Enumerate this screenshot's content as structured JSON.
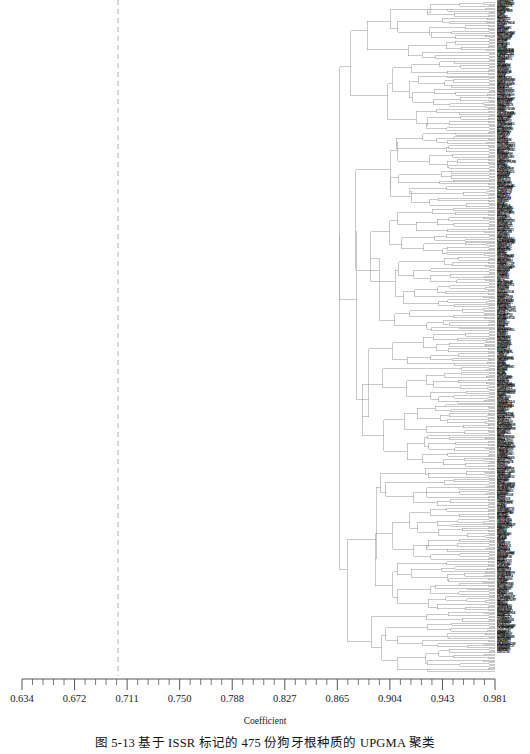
{
  "figure": {
    "caption": "图 5-13  基于 ISSR 标记的 475 份狗牙根种质的 UPGMA 聚类",
    "axis_title": "Coefficient",
    "sample_count": 475
  },
  "axis": {
    "tick_labels": [
      "0.634",
      "0.672",
      "0.711",
      "0.750",
      "0.788",
      "0.827",
      "0.865",
      "0.904",
      "0.943",
      "0.981"
    ],
    "minor_ticks_per_interval": 5,
    "x_left_px": 22,
    "x_right_px": 495
  },
  "cut_line": {
    "label": "cut-off-line",
    "coefficient": "0.706",
    "x_px": 118,
    "style": "dashed"
  },
  "colors": {
    "tree_line": "#9a9a9a",
    "tree_line_dark": "#7d7d7d",
    "axis": "#555555",
    "cut_line": "#aaaaaa",
    "text": "#1a1a1a",
    "background": "#ffffff"
  },
  "chart_data": {
    "type": "dendrogram",
    "title": "图 5-13  基于 ISSR 标记的 475 份狗牙根种质的 UPGMA 聚类",
    "xlabel": "Coefficient",
    "ylabel": "",
    "method": "UPGMA",
    "marker": "ISSR",
    "n_leaves": 475,
    "xlim": [
      0.634,
      0.981
    ],
    "grid": false,
    "legend": false,
    "xticks": [
      0.634,
      0.672,
      0.711,
      0.75,
      0.788,
      0.827,
      0.865,
      0.904,
      0.943,
      0.981
    ],
    "cut_line_x": 0.706,
    "root_merge_coefficient": 0.634,
    "note": "Leaf tip labels are rendered at sub-pixel size along the right margin and are not individually legible in the source image; one partially legible token reads 'green'.",
    "leaf_label_sample": [
      "green"
    ],
    "cluster_merge_levels": [
      0.634,
      0.66,
      0.672,
      0.681,
      0.69,
      0.698,
      0.706,
      0.714,
      0.722,
      0.73,
      0.738,
      0.746,
      0.754,
      0.762,
      0.77,
      0.778,
      0.786,
      0.794,
      0.802,
      0.81,
      0.818,
      0.826,
      0.834,
      0.842,
      0.85,
      0.858,
      0.866,
      0.874,
      0.882,
      0.89,
      0.898,
      0.906,
      0.914,
      0.922,
      0.93,
      0.938,
      0.946,
      0.954,
      0.962,
      0.97,
      0.978
    ]
  }
}
